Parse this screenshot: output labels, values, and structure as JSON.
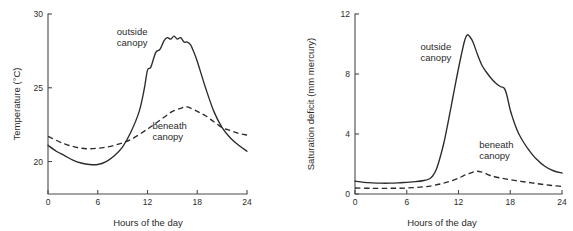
{
  "figure": {
    "panel_count": 2,
    "background_color": "#ffffff",
    "line_color": "#2b2b2b",
    "axis_color": "#4a4a4a"
  },
  "chart_data": [
    {
      "type": "line",
      "panel": "left",
      "title": "",
      "xlabel": "Hours of the day",
      "ylabel": "Temperature (°C)",
      "xlim": [
        0,
        24
      ],
      "ylim": [
        17.8,
        30
      ],
      "xticks": [
        0,
        6,
        12,
        18,
        24
      ],
      "xticklabels": [
        "0",
        "6",
        "12",
        "18",
        "24"
      ],
      "yticks": [
        20,
        25,
        30
      ],
      "yticklabels": [
        "20",
        "25",
        "30"
      ],
      "grid": false,
      "legend": "inline-annotations",
      "annotations": [
        {
          "text": "outside canopy",
          "lines": [
            "outside",
            "canopy"
          ],
          "x": 8.3,
          "y": 28.6,
          "series": "outside canopy"
        },
        {
          "text": "beneath canopy",
          "lines": [
            "beneath",
            "canopy"
          ],
          "x": 12.6,
          "y": 22.2,
          "series": "beneath canopy"
        }
      ],
      "series": [
        {
          "name": "outside canopy",
          "style": "solid",
          "x": [
            0,
            1,
            2,
            3,
            4,
            5,
            6,
            7,
            8,
            9,
            10,
            11,
            11.6,
            12,
            12.4,
            13,
            13.5,
            14,
            14.4,
            14.8,
            15.2,
            15.6,
            16,
            16.4,
            16.8,
            17.2,
            17.6,
            18,
            19,
            20,
            21,
            22,
            23,
            24
          ],
          "values": [
            21.1,
            20.7,
            20.4,
            20.1,
            19.9,
            19.8,
            19.8,
            20.0,
            20.4,
            21.0,
            22.0,
            23.4,
            24.9,
            26.2,
            26.4,
            27.4,
            27.6,
            28.2,
            28.4,
            28.3,
            28.5,
            28.3,
            28.4,
            28.1,
            28.1,
            27.9,
            27.4,
            26.8,
            25.0,
            23.4,
            22.3,
            21.6,
            21.1,
            20.7
          ]
        },
        {
          "name": "beneath canopy",
          "style": "dashed",
          "x": [
            0,
            2,
            4,
            6,
            8,
            10,
            12,
            13,
            14,
            15,
            16,
            16.8,
            18,
            19,
            20,
            21,
            22,
            23,
            24
          ],
          "values": [
            21.7,
            21.2,
            20.9,
            20.9,
            21.1,
            21.5,
            22.2,
            22.6,
            23.0,
            23.4,
            23.6,
            23.7,
            23.4,
            23.1,
            22.7,
            22.3,
            22.1,
            21.9,
            21.8
          ]
        }
      ]
    },
    {
      "type": "line",
      "panel": "right",
      "title": "",
      "xlabel": "Hours of the day",
      "ylabel": "Saturation deficit (mm mercury)",
      "xlim": [
        0,
        24
      ],
      "ylim": [
        0,
        12
      ],
      "xticks": [
        0,
        6,
        12,
        18,
        24
      ],
      "xticklabels": [
        "0",
        "6",
        "12",
        "18",
        "24"
      ],
      "yticks": [
        0,
        4,
        8,
        12
      ],
      "yticklabels": [
        "0",
        "4",
        "8",
        "12"
      ],
      "grid": false,
      "legend": "inline-annotations",
      "annotations": [
        {
          "text": "outside canopy",
          "lines": [
            "outside",
            "canopy"
          ],
          "x": 7.6,
          "y": 9.6,
          "series": "outside canopy"
        },
        {
          "text": "beneath canopy",
          "lines": [
            "beneath",
            "canopy"
          ],
          "x": 14.4,
          "y": 3.1,
          "series": "beneath canopy"
        }
      ],
      "series": [
        {
          "name": "outside canopy",
          "style": "solid",
          "x": [
            0,
            1,
            2,
            3,
            4,
            5,
            6,
            7,
            8,
            8.6,
            9,
            9.4,
            9.8,
            10.3,
            10.8,
            11.3,
            11.8,
            12.3,
            12.7,
            13,
            13.3,
            13.7,
            14.2,
            14.7,
            15.2,
            15.8,
            16.4,
            16.9,
            17.3,
            17.6,
            18,
            18.5,
            19,
            19.6,
            20.2,
            21,
            22,
            23,
            24
          ],
          "values": [
            0.85,
            0.78,
            0.74,
            0.72,
            0.72,
            0.74,
            0.78,
            0.82,
            0.9,
            1.0,
            1.2,
            1.6,
            2.3,
            3.4,
            4.8,
            6.3,
            7.8,
            9.2,
            10.2,
            10.6,
            10.5,
            10.1,
            9.3,
            8.6,
            8.15,
            7.7,
            7.35,
            7.15,
            7.05,
            6.6,
            5.6,
            4.7,
            4.0,
            3.4,
            2.9,
            2.35,
            1.85,
            1.55,
            1.4
          ]
        },
        {
          "name": "beneath canopy",
          "style": "dashed",
          "x": [
            0,
            2,
            4,
            6,
            8,
            9,
            10,
            11,
            12,
            12.6,
            13.2,
            13.8,
            14.2,
            14.6,
            15,
            15.6,
            16,
            17,
            18,
            19,
            20,
            21,
            22,
            23,
            24
          ],
          "values": [
            0.4,
            0.38,
            0.38,
            0.4,
            0.48,
            0.56,
            0.68,
            0.84,
            1.05,
            1.22,
            1.36,
            1.48,
            1.52,
            1.48,
            1.4,
            1.25,
            1.18,
            1.05,
            0.95,
            0.86,
            0.78,
            0.7,
            0.62,
            0.56,
            0.5
          ]
        }
      ]
    }
  ]
}
